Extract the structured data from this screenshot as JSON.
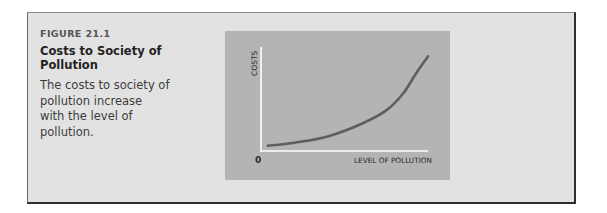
{
  "figure": {
    "label": "FIGURE 21.1",
    "title": "Costs to Society of Pollution",
    "description": "The costs to society of pollution increase with the level of pollution."
  },
  "colors": {
    "box_background": "#e2e2e2",
    "chart_background": "#b4b4b4",
    "axis": "#ffffff",
    "curve": "#5e5e5e"
  },
  "chart_data": {
    "type": "line",
    "title": "Costs to Society of Pollution",
    "xlabel": "LEVEL OF POLLUTION",
    "ylabel": "COSTS",
    "origin_label": "0",
    "grid": false,
    "legend": null,
    "x_ticks": [],
    "y_ticks": [],
    "series": [
      {
        "name": "Costs to society",
        "shape": "convex, increasing at an increasing rate",
        "x": [
          0.04,
          0.2,
          0.4,
          0.6,
          0.75,
          0.85,
          0.93,
          1.0
        ],
        "y": [
          0.05,
          0.08,
          0.14,
          0.26,
          0.39,
          0.55,
          0.75,
          0.91
        ]
      }
    ],
    "xlim": [
      0,
      1
    ],
    "ylim": [
      0,
      1
    ]
  }
}
